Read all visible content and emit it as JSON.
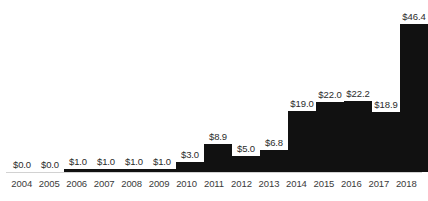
{
  "chart_data": {
    "type": "bar",
    "title": "",
    "subtitle": "",
    "xlabel": "",
    "ylabel": "",
    "grid": false,
    "legend": "none",
    "axis_line": true,
    "ylim": [
      0,
      46.4
    ],
    "value_prefix": "$",
    "bar_color": "#111111",
    "label_color": "#2b2b2b",
    "axis_label_color": "#3a3a3a",
    "axis_line_color": "#d2d2d2",
    "background_color": "#ffffff",
    "categories": [
      "2004",
      "2005",
      "2006",
      "2007",
      "2008",
      "2009",
      "2010",
      "2011",
      "2012",
      "2013",
      "2014",
      "2015",
      "2016",
      "2017",
      "2018"
    ],
    "values": [
      0.0,
      0.0,
      1.0,
      1.0,
      1.0,
      1.0,
      3.0,
      8.9,
      5.0,
      6.8,
      19.0,
      22.0,
      22.2,
      18.9,
      46.4
    ],
    "data_labels": [
      "$0.0",
      "$0.0",
      "$1.0",
      "$1.0",
      "$1.0",
      "$1.0",
      "$3.0",
      "$8.9",
      "$5.0",
      "$6.8",
      "$19.0",
      "$22.0",
      "$22.2",
      "$18.9",
      "$46.4"
    ],
    "points": [
      {
        "category": "2004",
        "value": 0.0,
        "label": "$0.0"
      },
      {
        "category": "2005",
        "value": 0.0,
        "label": "$0.0"
      },
      {
        "category": "2006",
        "value": 1.0,
        "label": "$1.0"
      },
      {
        "category": "2007",
        "value": 1.0,
        "label": "$1.0"
      },
      {
        "category": "2008",
        "value": 1.0,
        "label": "$1.0"
      },
      {
        "category": "2009",
        "value": 1.0,
        "label": "$1.0"
      },
      {
        "category": "2010",
        "value": 3.0,
        "label": "$3.0"
      },
      {
        "category": "2011",
        "value": 8.9,
        "label": "$8.9"
      },
      {
        "category": "2012",
        "value": 5.0,
        "label": "$5.0"
      },
      {
        "category": "2013",
        "value": 6.8,
        "label": "$6.8"
      },
      {
        "category": "2014",
        "value": 19.0,
        "label": "$19.0"
      },
      {
        "category": "2015",
        "value": 22.0,
        "label": "$22.0"
      },
      {
        "category": "2016",
        "value": 22.2,
        "label": "$22.2"
      },
      {
        "category": "2017",
        "value": 18.9,
        "label": "$18.9"
      },
      {
        "category": "2018",
        "value": 46.4,
        "label": "$46.4"
      }
    ]
  }
}
